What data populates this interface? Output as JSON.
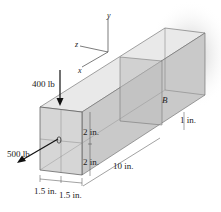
{
  "diagram": {
    "type": "engineering-mechanics-3d-beam",
    "axes": {
      "x": "x",
      "y": "y",
      "z": "z"
    },
    "loads": [
      {
        "label": "400 lb",
        "direction": "down"
      },
      {
        "label": "500 lb",
        "direction": "out-of-page-left"
      }
    ],
    "points": {
      "A": "A",
      "B": "B"
    },
    "dimensions": {
      "upper_height": "2 in.",
      "lower_height": "2 in.",
      "length": "10 in.",
      "offset_B": "1 in.",
      "width_left": "1.5 in.",
      "width_right": "1.5 in."
    },
    "colors": {
      "front_face": "#d9d9d9",
      "top_face": "#e8e8e8",
      "side_face": "#c8c8c8",
      "edge": "#555555",
      "shadow": "#bfbfbf"
    }
  }
}
